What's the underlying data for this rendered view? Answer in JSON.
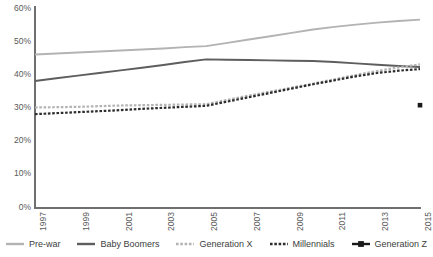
{
  "chart_data": {
    "type": "line",
    "title": "",
    "subtitle": "",
    "xlabel": "",
    "ylabel": "",
    "x": [
      1997,
      1998,
      1999,
      2000,
      2001,
      2002,
      2003,
      2004,
      2005,
      2006,
      2007,
      2008,
      2009,
      2010,
      2011,
      2012,
      2013,
      2014,
      2015
    ],
    "xtick_labels": [
      "1997",
      "1999",
      "2001",
      "2003",
      "2005",
      "2007",
      "2009",
      "2011",
      "2013",
      "2015"
    ],
    "xtick_values": [
      1997,
      1999,
      2001,
      2003,
      2005,
      2007,
      2009,
      2011,
      2013,
      2015
    ],
    "xlim": [
      1997,
      2015
    ],
    "ytick_labels": [
      "0%",
      "10%",
      "20%",
      "30%",
      "40%",
      "50%",
      "60%"
    ],
    "ytick_values": [
      0,
      10,
      20,
      30,
      40,
      50,
      60
    ],
    "ylim": [
      0,
      60
    ],
    "grid": false,
    "legend_position": "bottom",
    "value_unit": "percent",
    "series": [
      {
        "name": "Pre-war",
        "color": "#b3b3b3",
        "style": "solid",
        "marker": "none",
        "values": [
          46.0,
          46.3,
          46.6,
          46.9,
          47.2,
          47.5,
          47.8,
          48.2,
          48.5,
          49.5,
          50.5,
          51.5,
          52.5,
          53.5,
          54.3,
          55.0,
          55.6,
          56.1,
          56.5
        ]
      },
      {
        "name": "Baby Boomers",
        "color": "#5e5e5e",
        "style": "solid",
        "marker": "none",
        "values": [
          38.0,
          38.8,
          39.6,
          40.4,
          41.2,
          42.0,
          42.8,
          43.7,
          44.5,
          44.4,
          44.3,
          44.2,
          44.1,
          44.0,
          43.7,
          43.3,
          42.9,
          42.5,
          42.2
        ]
      },
      {
        "name": "Generation X",
        "color": "#b3b3b3",
        "style": "dashed",
        "marker": "none",
        "values": [
          30.0,
          30.1,
          30.2,
          30.4,
          30.6,
          30.7,
          30.8,
          30.9,
          31.0,
          32.3,
          33.6,
          34.8,
          36.0,
          37.2,
          38.5,
          39.8,
          41.0,
          42.1,
          43.0
        ]
      },
      {
        "name": "Millennials",
        "color": "#2d2d2d",
        "style": "dashed",
        "marker": "none",
        "values": [
          28.0,
          28.3,
          28.6,
          28.9,
          29.2,
          29.6,
          29.9,
          30.2,
          30.5,
          31.8,
          33.1,
          34.4,
          35.7,
          37.0,
          38.2,
          39.4,
          40.4,
          41.1,
          41.6
        ]
      },
      {
        "name": "Generation Z",
        "color": "#1a1a1a",
        "style": "solid",
        "marker": "square",
        "values": [
          null,
          null,
          null,
          null,
          null,
          null,
          null,
          null,
          null,
          null,
          null,
          null,
          null,
          null,
          null,
          null,
          null,
          null,
          30.7
        ]
      }
    ]
  },
  "legend": {
    "items": [
      {
        "label": "Pre-war"
      },
      {
        "label": "Baby Boomers"
      },
      {
        "label": "Generation X"
      },
      {
        "label": "Millennials"
      },
      {
        "label": "Generation Z"
      }
    ]
  }
}
